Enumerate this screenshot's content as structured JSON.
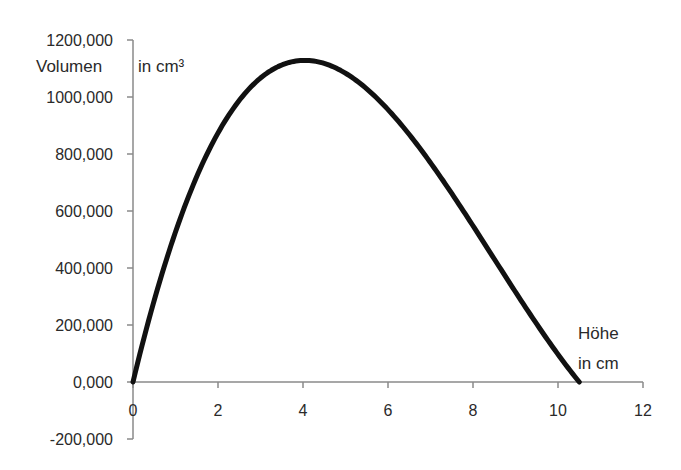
{
  "chart_data": {
    "type": "line",
    "title": "",
    "xlabel": "Höhe in cm",
    "ylabel": "Volumen in cm³",
    "xlabel_lines": [
      "Höhe",
      "in cm"
    ],
    "ylabel_parts": {
      "main": "Volumen",
      "unit": "in cm³"
    },
    "xlim": [
      0,
      12
    ],
    "ylim": [
      -200,
      1200
    ],
    "x_ticks": [
      0,
      2,
      4,
      6,
      8,
      10,
      12
    ],
    "x_tick_labels": [
      "0",
      "2",
      "4",
      "6",
      "8",
      "10",
      "12"
    ],
    "y_ticks": [
      -200,
      0,
      200,
      400,
      600,
      800,
      1000,
      1200
    ],
    "y_tick_labels": [
      "-200,000",
      "0,000",
      "200,000",
      "400,000",
      "600,000",
      "800,000",
      "1000,000",
      "1200,000"
    ],
    "grid": false,
    "legend": null,
    "series": [
      {
        "name": "Volumen",
        "color": "#111111",
        "x": [
          0,
          0.5,
          1,
          1.5,
          2,
          2.5,
          3,
          3.5,
          4,
          4.5,
          5,
          5.5,
          6,
          6.5,
          7,
          7.5,
          8,
          8.5,
          9,
          9.5,
          10,
          10.5
        ],
        "values": [
          0,
          287,
          532,
          735,
          902,
          1028,
          1120,
          1164,
          1128,
          1127,
          1085,
          1018,
          929,
          822,
          701,
          571,
          548,
          306,
          185,
          82,
          97,
          0
        ]
      }
    ],
    "annotations": [
      "Maximum ≈ 1130 cm³ bei h ≈ 4 cm",
      "Nullstelle bei h ≈ 10,5 cm"
    ]
  }
}
